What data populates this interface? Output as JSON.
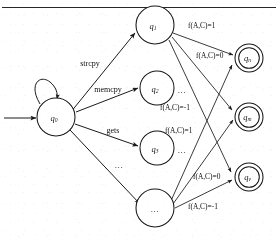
{
  "figure": {
    "kind": "finite-state-automaton-diagram",
    "top_rule_present": true,
    "top_caption_faint": "",
    "ink_color": "#1a1a1a",
    "background": "#ffffff"
  },
  "states": {
    "start": {
      "id": "q0",
      "label": "q",
      "subscript": "0",
      "accepting": false,
      "has_self_loop": true,
      "has_start_arrow": true
    },
    "middle": [
      {
        "id": "q1",
        "label": "q",
        "subscript": "1",
        "accepting": false,
        "side_note": ""
      },
      {
        "id": "q2",
        "label": "q",
        "subscript": "2",
        "accepting": false,
        "side_note": "..."
      },
      {
        "id": "q3",
        "label": "q",
        "subscript": "3",
        "accepting": false,
        "side_note": "..."
      },
      {
        "id": "qdots",
        "label": "...",
        "subscript": "",
        "accepting": false,
        "side_note": ""
      }
    ],
    "accepting": [
      {
        "id": "qn",
        "label": "q",
        "subscript": "n",
        "accepting": true
      },
      {
        "id": "qm",
        "label": "q",
        "subscript": "m",
        "accepting": true
      },
      {
        "id": "qv",
        "label": "q",
        "subscript": "v",
        "accepting": true
      }
    ]
  },
  "transitions": {
    "from_start": [
      {
        "to": "q1",
        "label": "strcpy"
      },
      {
        "to": "q2",
        "label": "memcpy"
      },
      {
        "to": "q3",
        "label": "gets"
      },
      {
        "to": "qdots",
        "label": "..."
      }
    ],
    "to_accepting": [
      {
        "from": "q1",
        "to": "qn",
        "label_fn": "f",
        "label_args": "(A,C)",
        "label_eq": "=1",
        "label_full": "f(A,C)=1"
      },
      {
        "from": "q1",
        "to": "qm",
        "label_fn": "f",
        "label_args": "(A,C)",
        "label_eq": "=0",
        "label_full": "f(A,C)=0"
      },
      {
        "from": "q1",
        "to": "qv",
        "label_fn": "f",
        "label_args": "(A,C)",
        "label_eq": "=-1",
        "label_full": "f(A,C)=-1"
      },
      {
        "from": "qdots",
        "to": "qn",
        "label_fn": "f",
        "label_args": "(A,C)",
        "label_eq": "=1",
        "label_full": "f(A,C)=1"
      },
      {
        "from": "qdots",
        "to": "qm",
        "label_fn": "f",
        "label_args": "(A,C)",
        "label_eq": "=0",
        "label_full": "f(A,C)=0"
      },
      {
        "from": "qdots",
        "to": "qv",
        "label_fn": "f",
        "label_args": "(A,C)",
        "label_eq": "=-1",
        "label_full": "f(A,C)=-1"
      }
    ]
  },
  "edge_labels": {
    "l_top_1": "f(A,C)=1",
    "l_top_0": "f(A,C)=0",
    "l_mid_neg1": "f(A,C)=-1",
    "l_mid_1": "f(A,C)=1",
    "l_bot_0": "f(A,C)=0",
    "l_bot_neg1": "f(A,C)=-1"
  },
  "annotations": {
    "q2_dots": "...",
    "q3_dots": "...",
    "q0_fourth_edge": "..."
  }
}
